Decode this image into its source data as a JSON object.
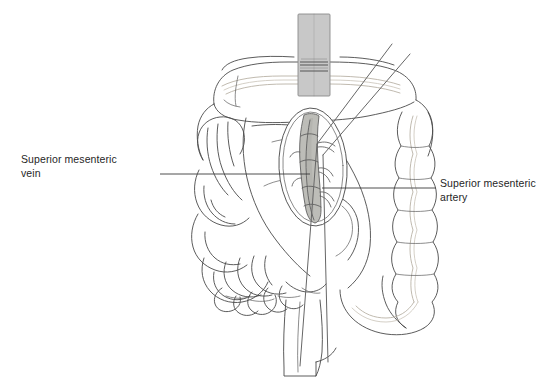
{
  "figure": {
    "background_color": "#ffffff",
    "width": 559,
    "height": 389
  },
  "labels": {
    "left": {
      "name": "superior-mesenteric-vein",
      "line1": "Superior mesenteric",
      "line2": "vein",
      "leader": {
        "x1": 160,
        "y1": 174,
        "x2": 310,
        "y2": 174
      }
    },
    "right": {
      "name": "superior-mesenteric-artery",
      "line1": "Superior mesenteric",
      "line2": "artery",
      "leader": {
        "x1": 322,
        "y1": 188,
        "x2": 436,
        "y2": 188
      }
    }
  },
  "colors": {
    "outline": "#4a4a4a",
    "outline_thin": "#5c5c5c",
    "omental_vessel": "#b9b2a6",
    "instrument_fill": "#c8c8c8",
    "instrument_stroke": "#8a8a8a",
    "vessel_fill": "#bdbdb8",
    "vessel_stroke": "#5a5a5a",
    "traction_line": "#666666",
    "label_text": "#262626",
    "background": "#ffffff"
  },
  "structures": [
    {
      "name": "transverse-colon",
      "description": "Transverse colon retracted superiorly across the top of the field"
    },
    {
      "name": "ascending-colon",
      "description": "Haustrated ascending colon on the right side of the field"
    },
    {
      "name": "small-bowel-loops",
      "description": "Coils of jejunum and ileum filling the left side of the field"
    },
    {
      "name": "mesenteric-window",
      "description": "Oval peritoneal window opened over the mesenteric root"
    },
    {
      "name": "superior-mesenteric-vein",
      "description": "Vertical vein within the window with tributary branches"
    },
    {
      "name": "superior-mesenteric-artery",
      "description": "Artery lying to the left of the vein within the window"
    },
    {
      "name": "duodenum-third-part",
      "description": "Vertical duodenal segment descending below the mesenteric root"
    },
    {
      "name": "retractor",
      "description": "Malleable retractor elevating the transverse colon"
    },
    {
      "name": "traction-sutures",
      "description": "Two diagonal traction lines running from upper right into the window"
    }
  ]
}
